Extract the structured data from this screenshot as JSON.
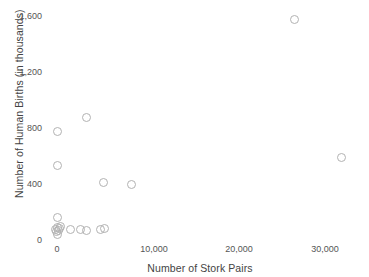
{
  "chart_data": {
    "type": "scatter",
    "title": "",
    "xlabel": "Number of Stork Pairs",
    "ylabel": "Number of Human Births (in thousands)",
    "xlim": [
      0,
      31500
    ],
    "ylim": [
      0,
      1640
    ],
    "grid": false,
    "legend": null,
    "marker": {
      "shape": "open-circle",
      "color": "#b2b2b2",
      "size_px": 9
    },
    "xticks": [
      {
        "value": 0,
        "label": "0"
      },
      {
        "value": 10000,
        "label": "10,000"
      },
      {
        "value": 20000,
        "label": "20,000"
      },
      {
        "value": 30000,
        "label": "30,000"
      }
    ],
    "yticks": [
      {
        "value": 0,
        "label": "0"
      },
      {
        "value": 400,
        "label": "400"
      },
      {
        "value": 800,
        "label": "800"
      },
      {
        "value": 1200,
        "label": "1,200"
      },
      {
        "value": 1600,
        "label": "1,600"
      }
    ],
    "x": [
      100,
      140,
      200,
      230,
      260,
      300,
      330,
      1400,
      1500,
      1700,
      2500,
      3300,
      5000,
      5200,
      5300,
      8000,
      24000,
      30000,
      700
    ],
    "y": [
      83,
      58,
      87,
      100,
      105,
      120,
      92,
      124,
      125,
      118,
      124,
      901,
      135,
      383,
      145,
      453,
      1598,
      621,
      230
    ],
    "points": [
      {
        "x": 100,
        "y": 83,
        "px": 56,
        "py": 231
      },
      {
        "x": 140,
        "y": 58,
        "px": 57,
        "py": 234
      },
      {
        "x": 200,
        "y": 87,
        "px": 58,
        "py": 230
      },
      {
        "x": 230,
        "y": 100,
        "px": 59,
        "py": 228
      },
      {
        "x": 260,
        "y": 105,
        "px": 57,
        "py": 227
      },
      {
        "x": 300,
        "y": 120,
        "px": 60,
        "py": 226
      },
      {
        "x": 330,
        "y": 92,
        "px": 55,
        "py": 229
      },
      {
        "x": 700,
        "y": 230,
        "px": 57,
        "py": 217
      },
      {
        "x": 1400,
        "y": 124,
        "px": 70,
        "py": 229
      },
      {
        "x": 1500,
        "y": 125,
        "px": 80,
        "py": 229
      },
      {
        "x": 1700,
        "y": 118,
        "px": 86,
        "py": 230
      },
      {
        "x": 2500,
        "y": 124,
        "px": 100,
        "py": 229
      },
      {
        "x": 3300,
        "y": 901,
        "px": 86,
        "py": 117
      },
      {
        "x": 5000,
        "y": 135,
        "px": 104,
        "py": 228
      },
      {
        "x": 5200,
        "y": 383,
        "px": 103,
        "py": 182
      },
      {
        "x": 5300,
        "y": 145,
        "px": 57,
        "py": 165
      },
      {
        "x": 8000,
        "y": 453,
        "px": 131,
        "py": 184
      },
      {
        "x": 24000,
        "y": 1598,
        "px": 294,
        "py": 19
      },
      {
        "x": 30000,
        "y": 621,
        "px": 341,
        "py": 157
      },
      {
        "x": 400,
        "y": 790,
        "px": 57,
        "py": 131
      }
    ]
  },
  "axes": {
    "x_title": "Number of Stork Pairs",
    "y_title": "Number of Human Births (in thousands)"
  }
}
